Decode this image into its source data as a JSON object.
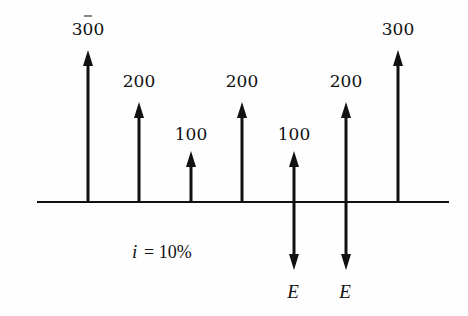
{
  "diagram": {
    "axis": {
      "x1": 37,
      "x2": 449,
      "y": 202
    },
    "interest_rate_label": "i = 10%",
    "interest_symbol": "i",
    "interest_value": "= 10%",
    "cash_flows": [
      {
        "period": 0,
        "x": 88,
        "direction": "up",
        "label": "300",
        "tip_y": 50
      },
      {
        "period": 1,
        "x": 139,
        "direction": "up",
        "label": "200",
        "tip_y": 102
      },
      {
        "period": 2,
        "x": 191,
        "direction": "up",
        "label": "100",
        "tip_y": 151
      },
      {
        "period": 3,
        "x": 242,
        "direction": "up",
        "label": "200",
        "tip_y": 102
      },
      {
        "period": 4,
        "x": 294,
        "direction": "up",
        "label": "100",
        "tip_y": 151
      },
      {
        "period": 5,
        "x": 346,
        "direction": "up",
        "label": "200",
        "tip_y": 102
      },
      {
        "period": 6,
        "x": 398,
        "direction": "up",
        "label": "300",
        "tip_y": 50
      }
    ],
    "outflows": [
      {
        "period": 4,
        "x": 294,
        "direction": "down",
        "label": "E",
        "tip_y": 270
      },
      {
        "period": 5,
        "x": 346,
        "direction": "down",
        "label": "E",
        "tip_y": 270
      }
    ]
  }
}
